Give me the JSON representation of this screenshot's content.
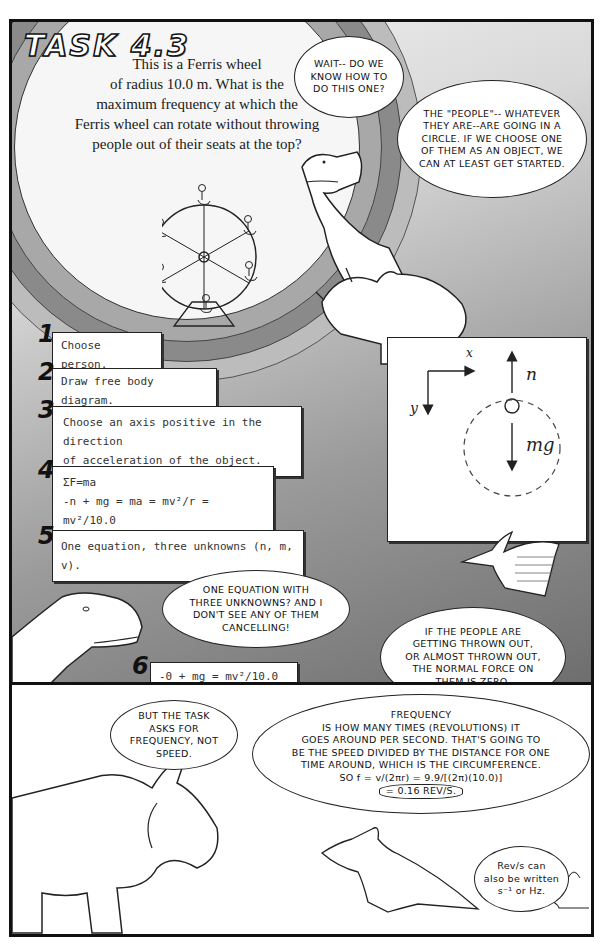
{
  "title": "TASK 4.3",
  "problem": {
    "lines": [
      "This is a Ferris wheel",
      "of radius 10.0 m. What is the",
      "maximum frequency at which the",
      "Ferris wheel can rotate without throwing",
      "people out of their seats at the top?"
    ]
  },
  "bubbles": {
    "wait": "WAIT-- DO WE KNOW HOW TO DO THIS ONE?",
    "people": "THE \"PEOPLE\"-- WHATEVER THEY ARE--ARE GOING IN A CIRCLE. IF WE CHOOSE ONE OF THEM AS AN OBJECT, WE CAN AT LEAST GET STARTED.",
    "one_equation": "ONE EQUATION WITH THREE UNKNOWNS? AND I DON'T SEE ANY OF THEM CANCELLING!",
    "thrown_out": "IF THE PEOPLE ARE GETTING THROWN OUT, OR ALMOST THROWN OUT, THE NORMAL FORCE ON THEM IS ZERO.",
    "but_the_task": "BUT THE TASK ASKS FOR FREQUENCY, NOT SPEED.",
    "frequency": {
      "lines": [
        "FREQUENCY",
        "IS HOW MANY TIMES (REVOLUTIONS) IT",
        "GOES AROUND PER SECOND. THAT'S GOING TO",
        "BE THE SPEED DIVIDED BY THE DISTANCE FOR ONE",
        "TIME AROUND, WHICH IS THE CIRCUMFERENCE.",
        "SO f = v/(2πr) = 9.9/[(2π)(10.0)]",
        "= 0.16 REV/S."
      ]
    },
    "rev_s": {
      "line1": "Rev/s can",
      "line2": "also be written",
      "line3": "s⁻¹ or Hz."
    }
  },
  "steps": [
    {
      "num": "1",
      "lines": [
        "Choose person."
      ]
    },
    {
      "num": "2",
      "lines": [
        "Draw free body diagram."
      ]
    },
    {
      "num": "3",
      "lines": [
        "Choose an axis positive in the direction",
        "of acceleration of the object."
      ]
    },
    {
      "num": "4",
      "lines": [
        "ΣF=ma",
        "-n + mg = ma = mv²/r = mv²/10.0"
      ]
    },
    {
      "num": "5",
      "lines": [
        "One equation, three unknowns (n, m, v)."
      ]
    },
    {
      "num": "6",
      "lines": [
        "-0 + mg = mv²/10.0",
        "g = v²/10.0;  v = 9.9"
      ]
    }
  ],
  "fbd": {
    "x_label": "x",
    "y_label": "y",
    "n_label": "n",
    "mg_label": "mg"
  }
}
